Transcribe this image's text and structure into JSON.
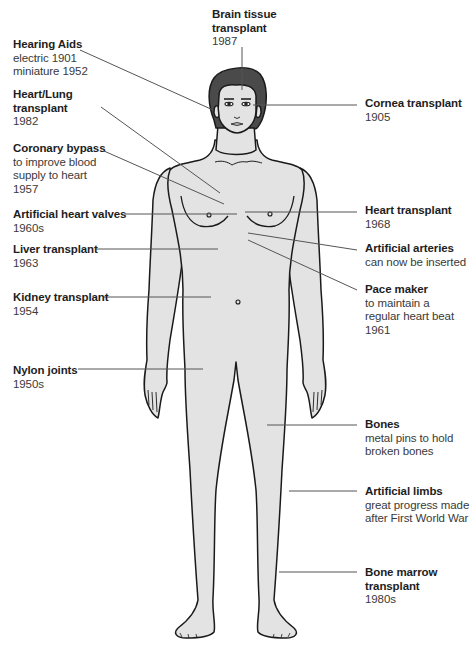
{
  "diagram": {
    "colors": {
      "skin": "#e3e3e3",
      "hair": "#4a4a4a",
      "outline": "#1a1a1a",
      "leader_line": "#555555",
      "text_title": "#1e1e1e",
      "text_desc": "#3a3a3a"
    },
    "labels": [
      {
        "id": "brain-tissue",
        "title": "Brain tissue transplant",
        "lines": [
          "Brain tissue",
          "transplant"
        ],
        "desc": [
          "1987"
        ],
        "side": "top",
        "x": 212,
        "y": 8
      },
      {
        "id": "hearing-aids",
        "title": "Hearing Aids",
        "lines": [
          "Hearing Aids"
        ],
        "desc": [
          "electric 1901",
          "miniature 1952"
        ],
        "side": "left",
        "x": 13,
        "y": 38
      },
      {
        "id": "cornea",
        "title": "Cornea transplant",
        "lines": [
          "Cornea transplant"
        ],
        "desc": [
          "1905"
        ],
        "side": "right",
        "x": 365,
        "y": 97
      },
      {
        "id": "heart-lung",
        "title": "Heart/Lung transplant",
        "lines": [
          "Heart/Lung",
          "transplant"
        ],
        "desc": [
          "1982"
        ],
        "side": "left",
        "x": 13,
        "y": 88
      },
      {
        "id": "coronary-bypass",
        "title": "Coronary bypass",
        "lines": [
          "Coronary bypass"
        ],
        "desc": [
          "to improve blood",
          "supply to heart",
          "1957"
        ],
        "side": "left",
        "x": 13,
        "y": 142
      },
      {
        "id": "heart-valves",
        "title": "Artificial heart valves",
        "lines": [
          "Artificial heart valves"
        ],
        "desc": [
          "1960s"
        ],
        "side": "left",
        "x": 13,
        "y": 208
      },
      {
        "id": "heart-transplant",
        "title": "Heart transplant",
        "lines": [
          "Heart transplant"
        ],
        "desc": [
          "1968"
        ],
        "side": "right",
        "x": 365,
        "y": 204
      },
      {
        "id": "artificial-arteries",
        "title": "Artificial arteries",
        "lines": [
          "Artificial arteries"
        ],
        "desc": [
          "can now be inserted"
        ],
        "side": "right",
        "x": 365,
        "y": 242
      },
      {
        "id": "liver",
        "title": "Liver transplant",
        "lines": [
          "Liver transplant"
        ],
        "desc": [
          "1963"
        ],
        "side": "left",
        "x": 13,
        "y": 243
      },
      {
        "id": "pace-maker",
        "title": "Pace maker",
        "lines": [
          "Pace maker"
        ],
        "desc": [
          "to maintain a",
          "regular heart beat",
          "1961"
        ],
        "side": "right",
        "x": 365,
        "y": 283
      },
      {
        "id": "kidney",
        "title": "Kidney transplant",
        "lines": [
          "Kidney transplant"
        ],
        "desc": [
          "1954"
        ],
        "side": "left",
        "x": 13,
        "y": 291
      },
      {
        "id": "nylon-joints",
        "title": "Nylon joints",
        "lines": [
          "Nylon joints"
        ],
        "desc": [
          "1950s"
        ],
        "side": "left",
        "x": 13,
        "y": 364
      },
      {
        "id": "bones",
        "title": "Bones",
        "lines": [
          "Bones"
        ],
        "desc": [
          "metal pins to hold",
          "broken bones"
        ],
        "side": "right",
        "x": 365,
        "y": 418
      },
      {
        "id": "artificial-limbs",
        "title": "Artificial limbs",
        "lines": [
          "Artificial limbs"
        ],
        "desc": [
          "great progress made",
          "after First World War"
        ],
        "side": "right",
        "x": 365,
        "y": 485
      },
      {
        "id": "bone-marrow",
        "title": "Bone marrow transplant",
        "lines": [
          "Bone marrow",
          "transplant"
        ],
        "desc": [
          "1980s"
        ],
        "side": "right",
        "x": 365,
        "y": 566
      }
    ],
    "leader_lines": [
      {
        "id": "brain-tissue",
        "x1": 242,
        "y1": 47,
        "x2": 242,
        "y2": 90
      },
      {
        "id": "hearing-aids",
        "x1": 80,
        "y1": 50,
        "x2": 213,
        "y2": 110
      },
      {
        "id": "cornea",
        "x1": 253,
        "y1": 105,
        "x2": 357,
        "y2": 105
      },
      {
        "id": "heart-lung",
        "x1": 101,
        "y1": 107,
        "x2": 220,
        "y2": 193
      },
      {
        "id": "coronary-bypass",
        "x1": 104,
        "y1": 151,
        "x2": 224,
        "y2": 204
      },
      {
        "id": "heart-valves",
        "x1": 125,
        "y1": 214,
        "x2": 237,
        "y2": 214
      },
      {
        "id": "heart-transplant",
        "x1": 245,
        "y1": 212,
        "x2": 357,
        "y2": 212
      },
      {
        "id": "artificial-arteries",
        "x1": 248,
        "y1": 233,
        "x2": 357,
        "y2": 250
      },
      {
        "id": "liver",
        "x1": 96,
        "y1": 249,
        "x2": 218,
        "y2": 249
      },
      {
        "id": "pace-maker",
        "x1": 248,
        "y1": 240,
        "x2": 357,
        "y2": 290
      },
      {
        "id": "kidney",
        "x1": 104,
        "y1": 297,
        "x2": 211,
        "y2": 297
      },
      {
        "id": "nylon-joints",
        "x1": 78,
        "y1": 369,
        "x2": 203,
        "y2": 369
      },
      {
        "id": "bones",
        "x1": 267,
        "y1": 425,
        "x2": 357,
        "y2": 425
      },
      {
        "id": "artificial-limbs",
        "x1": 289,
        "y1": 491,
        "x2": 357,
        "y2": 491
      },
      {
        "id": "bone-marrow",
        "x1": 279,
        "y1": 572,
        "x2": 357,
        "y2": 572
      }
    ]
  }
}
